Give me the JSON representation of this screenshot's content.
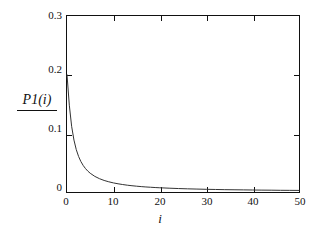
{
  "chart_data": {
    "type": "line",
    "title": "",
    "subtitle": "",
    "xlabel": "i",
    "ylabel": "P1(i)",
    "ylabel_has_rule": true,
    "xlim": [
      0,
      50
    ],
    "ylim": [
      0,
      0.3
    ],
    "grid": false,
    "legend": null,
    "frame": "box",
    "tick_direction": "in",
    "xticks": [
      0,
      10,
      20,
      30,
      40,
      50
    ],
    "xtick_labels": [
      "0",
      "10",
      "20",
      "30",
      "40",
      "50"
    ],
    "yticks": [
      0,
      0.1,
      0.2,
      0.3
    ],
    "ytick_labels": [
      "0",
      "0.1",
      "0.2",
      "0.3"
    ],
    "line_color": "#333333",
    "line_width": 1,
    "series": [
      {
        "name": "P1(i)",
        "x": [
          0,
          0.5,
          1,
          1.5,
          2,
          2.5,
          3,
          3.5,
          4,
          4.5,
          5,
          6,
          7,
          8,
          9,
          10,
          11,
          12,
          13,
          14,
          15,
          16,
          17,
          18,
          19,
          20,
          22,
          24,
          26,
          28,
          30,
          32,
          34,
          36,
          38,
          40,
          42,
          44,
          46,
          48,
          50
        ],
        "y": [
          0.2,
          0.148,
          0.112,
          0.0885,
          0.0722,
          0.0605,
          0.0518,
          0.0451,
          0.0398,
          0.0355,
          0.032,
          0.0266,
          0.0227,
          0.0197,
          0.0174,
          0.0155,
          0.014,
          0.0127,
          0.0116,
          0.0107,
          0.0099,
          0.0092,
          0.0086,
          0.0081,
          0.0076,
          0.0072,
          0.0065,
          0.0059,
          0.0054,
          0.005,
          0.0046,
          0.0043,
          0.004,
          0.0038,
          0.0036,
          0.0034,
          0.0032,
          0.0031,
          0.0029,
          0.0028,
          0.0027
        ]
      }
    ]
  },
  "axis": {
    "y_title": "P1(i)",
    "x_title": "i"
  }
}
